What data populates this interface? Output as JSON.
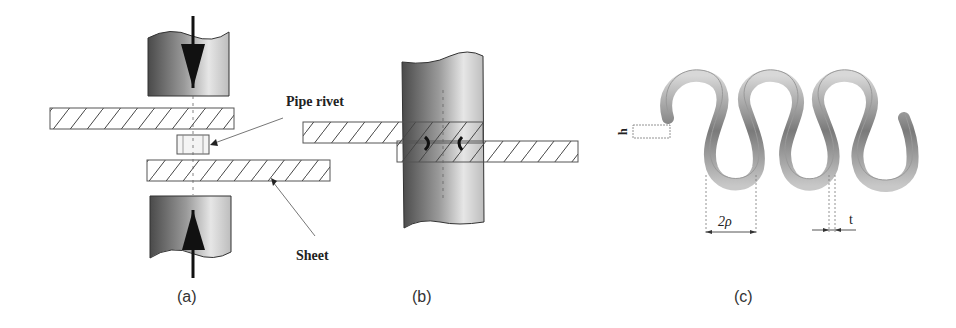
{
  "figure": {
    "panels": [
      {
        "id": "a",
        "caption": "(a)",
        "callouts": {
          "pipe_rivet": "Pipe rivet",
          "sheet": "Sheet"
        },
        "description": "Two punches pressing toward each other with a pipe rivet between two sheets"
      },
      {
        "id": "b",
        "caption": "(b)",
        "description": "Overlapping sheets joined by rivet inside a cylindrical punch"
      },
      {
        "id": "c",
        "caption": "(c)",
        "dimensions": {
          "height": "h",
          "pitch": "2ρ",
          "thickness": "t"
        },
        "description": "Serpentine corrugated strip"
      }
    ],
    "colors": {
      "punch_dark": "#555555",
      "punch_light": "#e8e8e8",
      "hatch": "#333333",
      "text": "#222222"
    }
  }
}
